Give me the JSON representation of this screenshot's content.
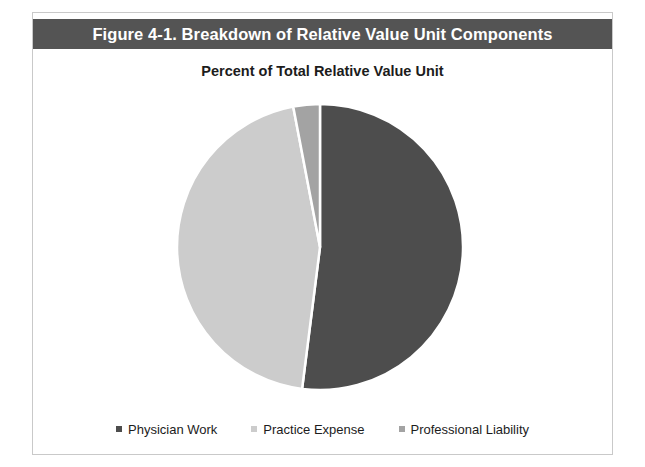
{
  "figure": {
    "title": "Figure 4-1. Breakdown of Relative Value Unit Components",
    "subtitle": "Percent of Total Relative Value Unit"
  },
  "colors": {
    "title_bar_background": "#545454",
    "title_text": "#ffffff",
    "frame_border": "#c9c9c9",
    "page_background": "#ffffff",
    "slice_separator": "#ffffff",
    "physician_work": "#4d4d4d",
    "practice_expense": "#cccccc",
    "professional_liability": "#a3a3a3",
    "text": "#1c1c1c"
  },
  "legend": {
    "position": "bottom",
    "items": [
      {
        "label": "Physician Work",
        "color": "#4d4d4d",
        "swatch": "square-swatch"
      },
      {
        "label": "Practice Expense",
        "color": "#cccccc",
        "swatch": "square-swatch"
      },
      {
        "label": "Professional Liability",
        "color": "#a3a3a3",
        "swatch": "square-swatch"
      }
    ]
  },
  "chart_data": {
    "type": "pie",
    "title": "Percent of Total Relative Value Unit",
    "subtitle": "",
    "xlabel": "",
    "ylabel": "",
    "grid": false,
    "legend_position": "bottom",
    "start_angle_deg": 0,
    "direction": "clockwise",
    "categories": [
      "Physician Work",
      "Practice Expense",
      "Professional Liability"
    ],
    "values": [
      52,
      45,
      3
    ],
    "units": "percent",
    "slices": [
      {
        "label": "Physician Work",
        "value": 52,
        "color": "#4d4d4d",
        "start_angle_deg": 0,
        "end_angle_deg": 187.2
      },
      {
        "label": "Practice Expense",
        "value": 45,
        "color": "#cccccc",
        "start_angle_deg": 187.2,
        "end_angle_deg": 349.2
      },
      {
        "label": "Professional Liability",
        "value": 3,
        "color": "#a3a3a3",
        "start_angle_deg": 349.2,
        "end_angle_deg": 360
      }
    ],
    "geometry": {
      "center_x": 287,
      "center_y": 157,
      "radius": 143
    }
  }
}
